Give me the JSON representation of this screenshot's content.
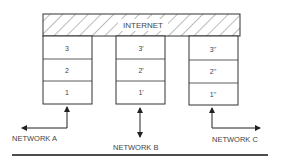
{
  "diagram": {
    "top_layer": {
      "label": "INTERNET",
      "pattern": "diagonal-hatch"
    },
    "stacks": [
      {
        "name": "A",
        "layers": [
          "3",
          "2",
          "1"
        ],
        "network_label": "NETWORK A",
        "arrow": "up-left"
      },
      {
        "name": "B",
        "layers": [
          "3'",
          "2'",
          "1'"
        ],
        "network_label": "NETWORK B",
        "arrow": "bidirectional-vertical"
      },
      {
        "name": "C",
        "layers": [
          "3''",
          "2''",
          "1''"
        ],
        "network_label": "NETWORK C",
        "arrow": "up-right"
      }
    ]
  },
  "colors": {
    "line": "#333333",
    "text": "#444444",
    "background": "#ffffff"
  }
}
